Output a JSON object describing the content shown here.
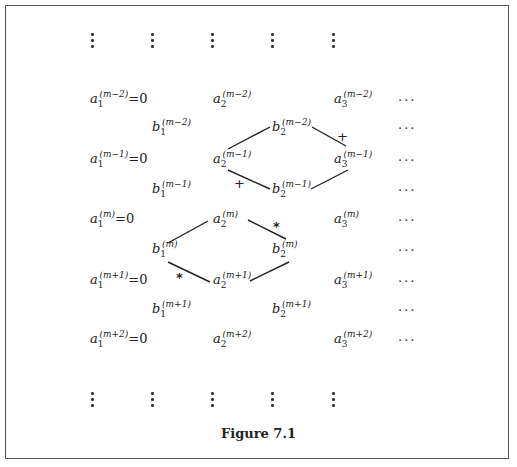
{
  "figure": {
    "caption": "Figure 7.1",
    "border_color": "#555555"
  },
  "vdots_columns_x": [
    92,
    152,
    212,
    272,
    333
  ],
  "rows": [
    {
      "id": "a_m-2",
      "y": 100,
      "terms": [
        {
          "label": "a",
          "sub": "1",
          "sup": "(m−2)",
          "suffix": "=0",
          "x": 90
        },
        {
          "label": "a",
          "sub": "2",
          "sup": "(m−2)",
          "suffix": "",
          "x": 213
        },
        {
          "label": "a",
          "sub": "3",
          "sup": "(m−2)",
          "suffix": "",
          "x": 334
        }
      ],
      "ellipsis": "···"
    },
    {
      "id": "b_m-2",
      "y": 127,
      "terms": [
        {
          "label": "b",
          "sub": "1",
          "sup": "(m−2)",
          "suffix": "",
          "x": 152
        },
        {
          "label": "b",
          "sub": "2",
          "sup": "(m−2)",
          "suffix": "",
          "x": 272
        }
      ],
      "ellipsis": "···"
    },
    {
      "id": "a_m-1",
      "y": 158,
      "terms": [
        {
          "label": "a",
          "sub": "1",
          "sup": "(m−1)",
          "suffix": "=0",
          "x": 90
        },
        {
          "label": "a",
          "sub": "2",
          "sup": "(m−1)",
          "suffix": "",
          "x": 213
        },
        {
          "label": "a",
          "sub": "3",
          "sup": "(m−1)",
          "suffix": "",
          "x": 334
        }
      ],
      "ellipsis": "···"
    },
    {
      "id": "b_m-1",
      "y": 189,
      "terms": [
        {
          "label": "b",
          "sub": "1",
          "sup": "(m−1)",
          "suffix": "",
          "x": 152
        },
        {
          "label": "b",
          "sub": "2",
          "sup": "(m−1)",
          "suffix": "",
          "x": 272
        }
      ],
      "ellipsis": "···"
    },
    {
      "id": "a_m",
      "y": 218,
      "terms": [
        {
          "label": "a",
          "sub": "1",
          "sup": "(m)",
          "suffix": "=0",
          "x": 90
        },
        {
          "label": "a",
          "sub": "2",
          "sup": "(m)",
          "suffix": "",
          "x": 213
        },
        {
          "label": "a",
          "sub": "3",
          "sup": "(m)",
          "suffix": "",
          "x": 334
        }
      ],
      "ellipsis": "···"
    },
    {
      "id": "b_m",
      "y": 248,
      "terms": [
        {
          "label": "b",
          "sub": "1",
          "sup": "(m)",
          "suffix": "",
          "x": 152
        },
        {
          "label": "b",
          "sub": "2",
          "sup": "(m)",
          "suffix": "",
          "x": 272
        }
      ],
      "ellipsis": "···"
    },
    {
      "id": "a_m+1",
      "y": 279,
      "terms": [
        {
          "label": "a",
          "sub": "1",
          "sup": "(m+1)",
          "suffix": "=0",
          "x": 90
        },
        {
          "label": "a",
          "sub": "2",
          "sup": "(m+1)",
          "suffix": "",
          "x": 213
        },
        {
          "label": "a",
          "sub": "3",
          "sup": "(m+1)",
          "suffix": "",
          "x": 334
        }
      ],
      "ellipsis": "···"
    },
    {
      "id": "b_m+1",
      "y": 308,
      "terms": [
        {
          "label": "b",
          "sub": "1",
          "sup": "(m+1)",
          "suffix": "",
          "x": 152
        },
        {
          "label": "b",
          "sub": "2",
          "sup": "(m+1)",
          "suffix": "",
          "x": 272
        }
      ],
      "ellipsis": "···"
    },
    {
      "id": "a_m+2",
      "y": 338,
      "terms": [
        {
          "label": "a",
          "sub": "1",
          "sup": "(m+2)",
          "suffix": "=0",
          "x": 90
        },
        {
          "label": "a",
          "sub": "2",
          "sup": "(m+2)",
          "suffix": "",
          "x": 213
        },
        {
          "label": "a",
          "sub": "3",
          "sup": "(m+2)",
          "suffix": "",
          "x": 334
        }
      ],
      "ellipsis": "···"
    }
  ],
  "signs": [
    {
      "symbol": "+",
      "x": 337,
      "y": 132,
      "meaning": "plus-rhombus-upper-right"
    },
    {
      "symbol": "+",
      "x": 234,
      "y": 179,
      "meaning": "plus-rhombus-lower-left"
    },
    {
      "symbol": "*",
      "x": 273,
      "y": 222,
      "meaning": "star-rhombus-upper-right"
    },
    {
      "symbol": "*",
      "x": 176,
      "y": 273,
      "meaning": "star-rhombus-lower-left"
    }
  ],
  "rhombi": [
    {
      "name": "plus-rhombus",
      "vertices": [
        "a2(m-1)",
        "b2(m-2)",
        "a3(m-1)",
        "b2(m-1)"
      ]
    },
    {
      "name": "star-rhombus",
      "vertices": [
        "b1(m)",
        "a2(m)",
        "b2(m)",
        "a2(m+1)"
      ]
    }
  ]
}
